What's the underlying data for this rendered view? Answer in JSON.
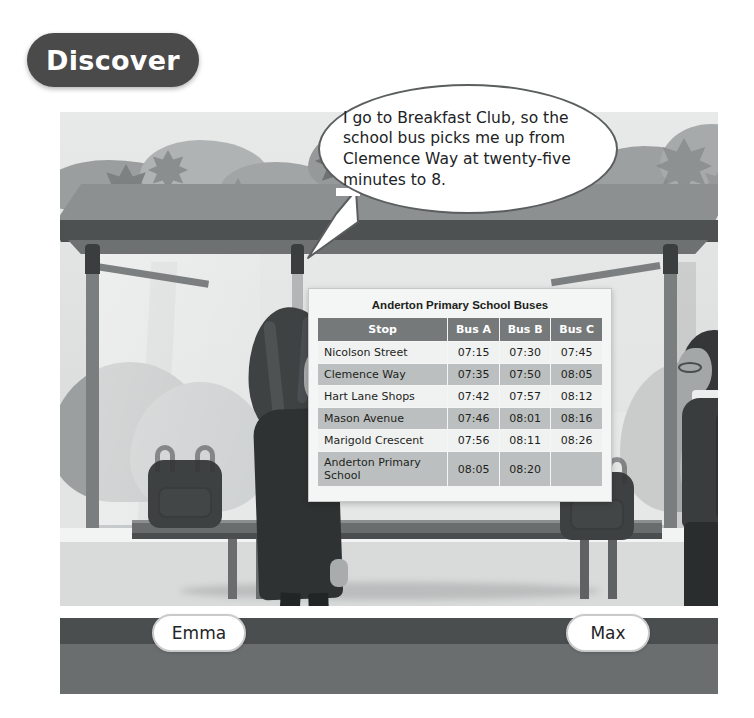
{
  "banner": {
    "label": "Discover"
  },
  "speech_bubble": {
    "speaker": "Emma",
    "text": "I go to Breakfast Club, so the school bus picks me up from Clemence Way at twenty-five minutes to 8."
  },
  "timetable": {
    "title": "Anderton Primary School Buses",
    "columns": [
      "Stop",
      "Bus A",
      "Bus B",
      "Bus C"
    ],
    "rows": [
      {
        "stop": "Nicolson Street",
        "bus_a": "07:15",
        "bus_b": "07:30",
        "bus_c": "07:45"
      },
      {
        "stop": "Clemence Way",
        "bus_a": "07:35",
        "bus_b": "07:50",
        "bus_c": "08:05"
      },
      {
        "stop": "Hart Lane Shops",
        "bus_a": "07:42",
        "bus_b": "07:57",
        "bus_c": "08:12"
      },
      {
        "stop": "Mason Avenue",
        "bus_a": "07:46",
        "bus_b": "08:01",
        "bus_c": "08:16"
      },
      {
        "stop": "Marigold Crescent",
        "bus_a": "07:56",
        "bus_b": "08:11",
        "bus_c": "08:26"
      },
      {
        "stop": "Anderton Primary School",
        "bus_a": "08:05",
        "bus_b": "08:20",
        "bus_c": ""
      }
    ]
  },
  "characters": {
    "left": {
      "name": "Emma"
    },
    "right": {
      "name": "Max"
    }
  },
  "colors": {
    "banner_bg": "#4a4a4a",
    "banner_text": "#ffffff",
    "table_header_bg": "#75797a",
    "table_row_odd": "#f0f1f1",
    "table_row_even": "#bcbfbf",
    "namebar_dark": "#4b4e4f",
    "namebar_light": "#6b6e6f",
    "bubble_border": "#5b5e5f"
  }
}
